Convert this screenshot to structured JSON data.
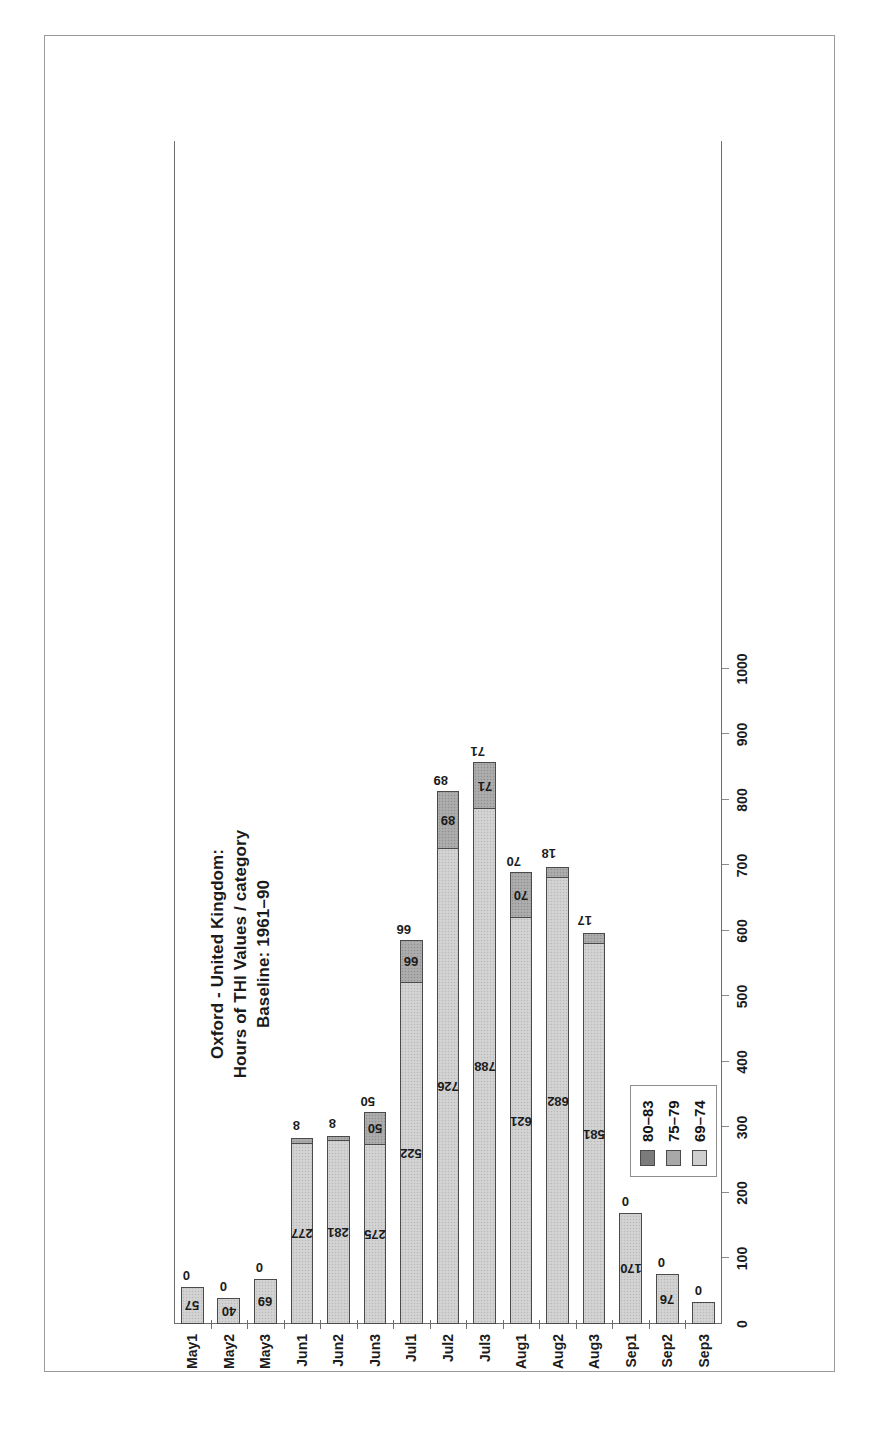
{
  "figure": {
    "title_lines": [
      "Oxford - United Kingdom:",
      "Hours of THI Values / category",
      "Baseline: 1961–90"
    ],
    "title_line1": "Oxford - United Kingdom:",
    "title_line2": "Hours of THI Values / category",
    "title_line3": "Baseline: 1961–90",
    "orientation": "page-rotated-90-ccw",
    "colors": {
      "series_80_83": "#7b7b7b",
      "series_75_79": "#a8a8a8",
      "series_69_74": "#cfcfcf",
      "frame": "#6e6e6e",
      "text": "#1b1b1b",
      "background": "#ffffff"
    }
  },
  "legend": {
    "position": "top-left",
    "entries": [
      {
        "label": "80–83",
        "swatch": "#7b7b7b",
        "swatch_name": "legend-swatch-80-83"
      },
      {
        "label": "75–79",
        "swatch": "#a8a8a8",
        "swatch_name": "legend-swatch-75-79"
      },
      {
        "label": "69–74",
        "swatch": "#cfcfcf",
        "swatch_name": "legend-swatch-69-74"
      }
    ]
  },
  "chart_data": {
    "type": "bar",
    "subtype": "stacked-horizontal",
    "title": "Oxford - United Kingdom: Hours of THI Values / category  Baseline: 1961–90",
    "xlabel": "",
    "ylabel": "",
    "grid": false,
    "legend_position": "top-left",
    "categories": [
      "May1",
      "May2",
      "May3",
      "Jun1",
      "Jun2",
      "Jun3",
      "Jul1",
      "Jul2",
      "Jul3",
      "Aug1",
      "Aug2",
      "Aug3",
      "Sep1",
      "Sep2",
      "Sep3"
    ],
    "value_axis": {
      "ticks": [
        0,
        100,
        200,
        300,
        400,
        500,
        600,
        700,
        800,
        900,
        1000
      ],
      "tick_labels": [
        "0",
        "100",
        "200",
        "300",
        "400",
        "500",
        "600",
        "700",
        "800",
        "900",
        "1000"
      ],
      "lim": [
        0,
        1000
      ],
      "direction": "reversed-on-page"
    },
    "series": [
      {
        "name": "69–74",
        "color": "#cfcfcf",
        "values": [
          57,
          40,
          69,
          277,
          281,
          275,
          522,
          726,
          788,
          621,
          682,
          581,
          170,
          76,
          33
        ]
      },
      {
        "name": "75–79",
        "color": "#a8a8a8",
        "values": [
          0,
          0,
          0,
          8,
          8,
          50,
          66,
          89,
          71,
          70,
          18,
          17,
          0,
          0,
          0
        ]
      },
      {
        "name": "80–83",
        "color": "#7b7b7b",
        "values": [
          0,
          0,
          0,
          0,
          0,
          0,
          0,
          0,
          0,
          0,
          0,
          0,
          0,
          0,
          0
        ]
      }
    ],
    "bar_labels": {
      "inner_69_74": [
        "57",
        "40",
        "69",
        "277",
        "281",
        "275",
        "522",
        "726",
        "788",
        "621",
        "682",
        "581",
        "170",
        "76",
        "33"
      ],
      "outer_75_79": [
        "0",
        "0",
        "0",
        "8",
        "8",
        "50",
        "66",
        "89",
        "71",
        "70",
        "18",
        "17",
        "0",
        "0",
        "0"
      ]
    },
    "totals": [
      57,
      40,
      69,
      285,
      289,
      325,
      588,
      815,
      859,
      691,
      700,
      598,
      170,
      76,
      33
    ]
  }
}
